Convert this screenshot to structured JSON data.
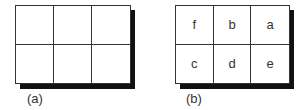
{
  "panels": [
    {
      "id": "a",
      "caption": "(a)",
      "cells": [
        "",
        "",
        "",
        "",
        "",
        ""
      ]
    },
    {
      "id": "b",
      "caption": "(b)",
      "cells": [
        "f",
        "b",
        "a",
        "c",
        "d",
        "e"
      ]
    }
  ]
}
